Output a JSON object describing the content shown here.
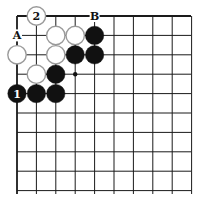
{
  "diagram": {
    "type": "go-board-corner",
    "grid": {
      "origin_x": 17,
      "origin_y": 16,
      "spacing": 19.4,
      "cols": 10,
      "rows": 10,
      "line_end_x": 191,
      "line_end_y": 194,
      "line_color": "#1a1a1a",
      "edge_top": true,
      "edge_left": true
    },
    "stones": [
      {
        "color": "white",
        "col": 1,
        "row": 0,
        "label": "2"
      },
      {
        "color": "white",
        "col": 2,
        "row": 1,
        "label": ""
      },
      {
        "color": "white",
        "col": 3,
        "row": 1,
        "label": ""
      },
      {
        "color": "black",
        "col": 4,
        "row": 1,
        "label": ""
      },
      {
        "color": "white",
        "col": 0,
        "row": 2,
        "label": ""
      },
      {
        "color": "white",
        "col": 2,
        "row": 2,
        "label": ""
      },
      {
        "color": "black",
        "col": 3,
        "row": 2,
        "label": ""
      },
      {
        "color": "black",
        "col": 4,
        "row": 2,
        "label": ""
      },
      {
        "color": "white",
        "col": 1,
        "row": 3,
        "label": ""
      },
      {
        "color": "black",
        "col": 2,
        "row": 3,
        "label": ""
      },
      {
        "color": "black",
        "col": 0,
        "row": 4,
        "label": "1"
      },
      {
        "color": "black",
        "col": 1,
        "row": 4,
        "label": ""
      },
      {
        "color": "black",
        "col": 2,
        "row": 4,
        "label": ""
      }
    ],
    "letter_marks": [
      {
        "text": "A",
        "col": 0,
        "row": 1
      },
      {
        "text": "B",
        "col": 4,
        "row": 0
      }
    ],
    "star_points": [
      {
        "col": 3,
        "row": 3
      }
    ],
    "colors": {
      "black": "#111111",
      "white": "#ffffff",
      "white_stroke": "#9a9a9a"
    }
  }
}
